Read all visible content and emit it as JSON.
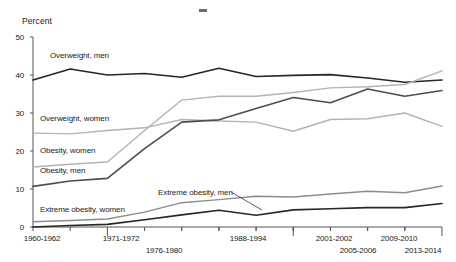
{
  "chart_data": {
    "type": "line",
    "title": "",
    "xlabel": "",
    "ylabel": "Percent",
    "ylim": [
      0,
      50
    ],
    "yticks": [
      0,
      10,
      20,
      30,
      40,
      50
    ],
    "grid": false,
    "legend_position": "inline-labels",
    "categories": [
      "1960-1962",
      "1971-1972",
      "1976-1980",
      "1988-1994",
      "1999-2000",
      "2001-2002",
      "2003-2004",
      "2005-2006",
      "2007-2008",
      "2009-2010",
      "2011-2012",
      "2013-2014"
    ],
    "tick_labels_shown": [
      "1960-1962",
      "1971-1972",
      "1976-1980",
      "1988-1994",
      "2001-2002",
      "2005-2006",
      "2009-2010",
      "2013-2014"
    ],
    "series": [
      {
        "name": "Overweight, men",
        "color": "#262626",
        "values": [
          38.7,
          41.6,
          40.0,
          40.4,
          39.4,
          41.8,
          39.6,
          39.9,
          40.1,
          39.2,
          38.1,
          38.7
        ]
      },
      {
        "name": "Overweight, women",
        "color": "#b3b3b3",
        "values": [
          24.7,
          24.5,
          25.4,
          26.1,
          28.3,
          27.9,
          27.6,
          25.2,
          28.3,
          28.5,
          30.0,
          26.5
        ]
      },
      {
        "name": "Obesity, women",
        "color": "#b3b3b3",
        "values": [
          15.8,
          16.5,
          17.1,
          25.4,
          33.4,
          34.4,
          34.4,
          35.4,
          36.6,
          36.9,
          37.5,
          41.1
        ]
      },
      {
        "name": "Obesity, men",
        "color": "#4d4d4d",
        "values": [
          10.7,
          12.1,
          12.8,
          20.6,
          27.6,
          28.2,
          31.2,
          34.1,
          32.7,
          36.3,
          34.4,
          35.9
        ]
      },
      {
        "name": "Extreme obesity, men",
        "color": "#262626",
        "values": [
          0.0,
          0.4,
          0.7,
          1.9,
          3.2,
          4.4,
          3.1,
          4.5,
          4.8,
          5.1,
          5.1,
          6.2
        ]
      },
      {
        "name": "Extreme obesity, women",
        "color": "#8c8c8c",
        "values": [
          1.4,
          1.7,
          2.1,
          3.9,
          6.4,
          7.2,
          8.1,
          7.9,
          8.7,
          9.4,
          9.0,
          10.8
        ]
      }
    ],
    "annotations": [
      {
        "text": "Overweight, men",
        "x": 50,
        "y": 57
      },
      {
        "text": "Overweight, women",
        "x": 40,
        "y": 120
      },
      {
        "text": "Obesity, women",
        "x": 40,
        "y": 152
      },
      {
        "text": "Obesity, men",
        "x": 40,
        "y": 172
      },
      {
        "text": "Extreme obesity, men",
        "x": 158,
        "y": 194
      },
      {
        "text": "Extreme obesity, women",
        "x": 40,
        "y": 211
      }
    ]
  },
  "axis": {
    "y_label": "Percent",
    "y_ticks": [
      "50",
      "40",
      "30",
      "20",
      "10",
      "0"
    ],
    "x_ticks": [
      {
        "label": "1960-1962",
        "row": 0
      },
      {
        "label": "1971-1972",
        "row": 0
      },
      {
        "label": "1976-1980",
        "row": 1
      },
      {
        "label": "1988-1994",
        "row": 0
      },
      {
        "label": "2001-2002",
        "row": 0
      },
      {
        "label": "2005-2006",
        "row": 1
      },
      {
        "label": "2009-2010",
        "row": 0
      },
      {
        "label": "2013-2014",
        "row": 1
      }
    ]
  }
}
